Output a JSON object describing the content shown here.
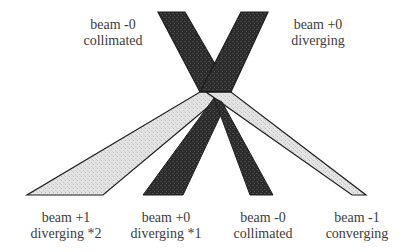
{
  "diagram": {
    "colors": {
      "dark_beam": "#2b2b2b",
      "light_beam": "#dedede",
      "outline": "#1e1e1e",
      "text": "#3c3c3c",
      "background": "#ffffff"
    },
    "beams": [
      {
        "id": "upper-left",
        "type": "dark",
        "points": "158,12 185,12 231,92 200,92"
      },
      {
        "id": "upper-right",
        "type": "dark",
        "points": "241,12 268,12 231,92 200,92"
      },
      {
        "id": "lower-left-light",
        "type": "light",
        "points": "200,92 226,92 103,195 27,195"
      },
      {
        "id": "lower-right-light",
        "type": "light",
        "points": "209,92 231,92 366,195 352,195"
      },
      {
        "id": "lower-left-dark",
        "type": "dark",
        "points": "212,100 226,112 183,195 143,195"
      },
      {
        "id": "lower-right-dark",
        "type": "dark",
        "points": "212,100 223,104 273,195 250,195"
      }
    ],
    "labels": {
      "top_left": {
        "line1": "beam -0",
        "line2": "collimated"
      },
      "top_right": {
        "line1": "beam +0",
        "line2": "diverging"
      },
      "bottom_1": {
        "line1": "beam +1",
        "line2": "diverging *2"
      },
      "bottom_2": {
        "line1": "beam +0",
        "line2": "diverging *1"
      },
      "bottom_3": {
        "line1": "beam -0",
        "line2": "collimated"
      },
      "bottom_4": {
        "line1": "beam -1",
        "line2": "converging"
      }
    }
  }
}
